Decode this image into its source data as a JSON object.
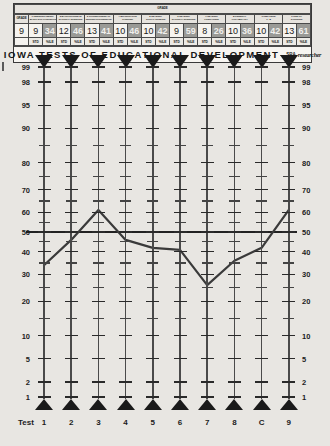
{
  "header": {
    "grade_label": "GRADE",
    "grade_value": "9",
    "columns": [
      {
        "title_line1": "1 UNDERSTANDING",
        "title_line2": "BASIC SOC CONCEPTS",
        "std": "9",
        "pct": "34"
      },
      {
        "title_line1": "2 BACKGROUND IN",
        "title_line2": "NATURAL SCIENCES",
        "std": "12",
        "pct": "46"
      },
      {
        "title_line1": "3 CORRECTNESS OF",
        "title_line2": "WRITING EXPRESSION",
        "std": "13",
        "pct": "41"
      },
      {
        "title_line1": "4 QUANTITATIVE",
        "title_line2": "THINKING",
        "std": "10",
        "pct": "46"
      },
      {
        "title_line1": "5 READING",
        "title_line2": "SOCIAL STUDIES",
        "std": "10",
        "pct": "42"
      },
      {
        "title_line1": "6 READING",
        "title_line2": "NATURAL SCIENCES",
        "std": "9",
        "pct": "59"
      },
      {
        "title_line1": "7 READING",
        "title_line2": "LITERATURE",
        "std": "8",
        "pct": "26"
      },
      {
        "title_line1": "8 GENERAL",
        "title_line2": "VOCABULARY",
        "std": "10",
        "pct": "36"
      },
      {
        "title_line1": "COMPOSITE",
        "title_line2": "1 - 8",
        "std": "10",
        "pct": "42"
      },
      {
        "title_line1": "9 USE OF",
        "title_line2": "SOURCES",
        "std": "13",
        "pct": "61"
      }
    ],
    "sub_std": "STD",
    "sub_pct": "%ILE",
    "banner_title": "IOWA TESTS OF EDUCATIONAL DEVELOPMENT",
    "banner_dash": "–",
    "banner_org": "SRA",
    "banner_script": "researcher"
  },
  "chart_data": {
    "type": "line",
    "title": "IOWA TESTS OF EDUCATIONAL DEVELOPMENT",
    "xlabel": "Test",
    "ylabel": "Percentile Rank",
    "categories": [
      "1",
      "2",
      "3",
      "4",
      "5",
      "6",
      "7",
      "8",
      "C",
      "9"
    ],
    "values": [
      34,
      46,
      61,
      46,
      42,
      41,
      26,
      36,
      42,
      61
    ],
    "y_ticks": [
      99,
      98,
      95,
      90,
      80,
      70,
      60,
      50,
      40,
      30,
      20,
      10,
      5,
      2,
      1
    ],
    "ylim": [
      1,
      99
    ],
    "reference_line": 50,
    "grid": false,
    "legend": "none",
    "series": [
      {
        "name": "Percentile Rank Profile",
        "values": [
          34,
          46,
          61,
          46,
          42,
          41,
          26,
          36,
          42,
          61
        ]
      }
    ],
    "standard_scores": [
      9,
      12,
      13,
      10,
      10,
      9,
      8,
      10,
      10,
      13
    ]
  },
  "axis": {
    "test_word": "Test"
  }
}
